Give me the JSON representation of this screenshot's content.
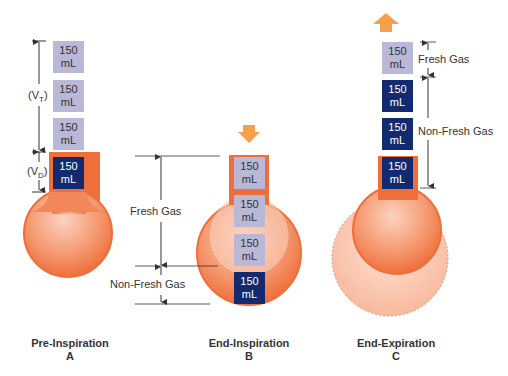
{
  "colors": {
    "fresh_box": "#b9b8d6",
    "nonfresh_box": "#132a6e",
    "lung_orange": "#f07a45",
    "lung_light": "#f9c6ad",
    "arrow": "#f6a04a"
  },
  "box_label_value": "150",
  "box_label_unit": "mL",
  "panels": [
    {
      "id": "A",
      "title": "Pre-Inspiration",
      "letter": "A",
      "vt_label": "(V",
      "vt_sub": "T",
      "vd_label": "(V",
      "vd_sub": "D"
    },
    {
      "id": "B",
      "title": "End-Inspiration",
      "letter": "B",
      "fresh_label": "Fresh Gas",
      "nonfresh_label": "Non-Fresh Gas"
    },
    {
      "id": "C",
      "title": "End-Expiration",
      "letter": "C",
      "fresh_label": "Fresh Gas",
      "nonfresh_label": "Non-Fresh Gas"
    }
  ]
}
